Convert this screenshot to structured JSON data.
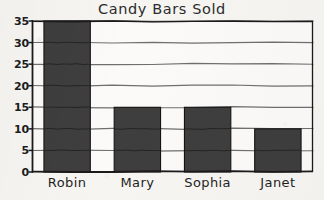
{
  "chart_data": {
    "type": "bar",
    "title": "Candy Bars Sold",
    "xlabel": "",
    "ylabel": "",
    "categories": [
      "Robin",
      "Mary",
      "Sophia",
      "Janet"
    ],
    "values": [
      35,
      15,
      15,
      10
    ],
    "ylim": [
      0,
      35
    ],
    "yticks": [
      0,
      5,
      10,
      15,
      20,
      25,
      30,
      35
    ],
    "ytick_labels": [
      "0",
      "5",
      "10",
      "15",
      "20",
      "25",
      "30",
      "35"
    ],
    "grid": true,
    "grid_axis": "y",
    "legend": false,
    "bar_color": "#3e3e3e",
    "bar_edge_color": "#141414",
    "grid_color": "#6f6f6f",
    "axis_color": "#1a1a1a",
    "plot_background": "#fbfaf8",
    "figure_background": "#f6f5f2",
    "text_color": "#1f1f1f"
  }
}
